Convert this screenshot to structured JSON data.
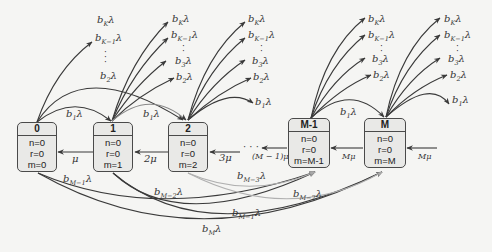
{
  "diagram": {
    "type": "markov-chain-state-transition",
    "states": [
      {
        "id": "0",
        "title": "0",
        "n": "n=0",
        "r": "r=0",
        "m": "m=0"
      },
      {
        "id": "1",
        "title": "1",
        "n": "n=0",
        "r": "r=0",
        "m": "m=1"
      },
      {
        "id": "2",
        "title": "2",
        "n": "n=0",
        "r": "r=0",
        "m": "m=2"
      },
      {
        "id": "M-1",
        "title": "M-1",
        "n": "n=0",
        "r": "r=0",
        "m": "m=M-1"
      },
      {
        "id": "M",
        "title": "M",
        "n": "n=0",
        "r": "r=0",
        "m": "m=M"
      }
    ],
    "fan_labels": {
      "bK": "b",
      "bK_sub": "K",
      "bK1_sub": "K−1",
      "b3_sub": "3",
      "b2_sub": "2",
      "b1_sub": "1",
      "lambda": "λ"
    },
    "forward_labels": {
      "b1_0_1": "b₁λ",
      "b1_1_2": "b₁λ",
      "b1_M1_M": "b₁λ"
    },
    "service_labels": {
      "mu_1_0": "μ",
      "mu_2_1": "2μ",
      "mu_3_2": "3μ",
      "mu_M1": "(M − 1)μ",
      "mu_M_M1": "Mμ",
      "mu_in_M": "Mμ",
      "ellipsis": "· · ·"
    },
    "bottom_labels": {
      "bM1_0": "M−1",
      "bM2_1": "M−2",
      "bM3_2": "M−3",
      "bM2_M": "M−2",
      "bM1_M": "M−1",
      "bM_M": "M"
    },
    "colors": {
      "stroke": "#3a3a3a",
      "light_stroke": "#b8b8b8",
      "box_fill": "#e9e9e7",
      "background": "#f5f5f3"
    }
  }
}
